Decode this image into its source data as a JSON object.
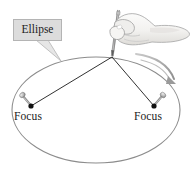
{
  "figure": {
    "width": 192,
    "height": 170,
    "background_color": "#ffffff"
  },
  "callout": {
    "label": "Ellipse",
    "box_fill": "#dcdcdc",
    "box_border": "#b4b4b4",
    "text_color": "#1c1c1c"
  },
  "labels": {
    "focus_left": "Focus",
    "focus_right": "Focus",
    "text_color": "#1a1a1a"
  },
  "ellipse": {
    "center_x": 96,
    "center_y": 110,
    "radius_x": 84,
    "radius_y": 53,
    "stroke_color": "#8c8c8c",
    "stroke_width": 1.1,
    "fill": "none"
  },
  "foci": [
    {
      "name": "focus-left",
      "x": 31,
      "y": 106,
      "dot_color": "#111111",
      "dot_radius": 2.6
    },
    {
      "name": "focus-right",
      "x": 154,
      "y": 106,
      "dot_color": "#111111",
      "dot_radius": 2.6
    }
  ],
  "pencil_point": {
    "x": 112,
    "y": 57
  },
  "string": {
    "stroke_color": "#1a1a1a",
    "stroke_width": 0.9,
    "segments": [
      {
        "name": "string-to-left-focus",
        "from_x": 112,
        "from_y": 57,
        "to_x": 31,
        "to_y": 106
      },
      {
        "name": "string-to-right-focus",
        "from_x": 112,
        "from_y": 57,
        "to_x": 154,
        "to_y": 106
      }
    ]
  },
  "pins": [
    {
      "name": "pin-left",
      "head_x": 23,
      "head_y": 96,
      "tip_x": 31,
      "tip_y": 105,
      "color": "#9a9a9a"
    },
    {
      "name": "pin-right",
      "head_x": 162,
      "head_y": 96,
      "tip_x": 155,
      "tip_y": 105,
      "color": "#9a9a9a"
    }
  ],
  "pencil": {
    "name": "pencil",
    "top_x": 118,
    "top_y": 10,
    "tip_x": 112,
    "tip_y": 57,
    "body_color": "#b8b8b8",
    "outline_color": "#6f6f6f"
  },
  "hand": {
    "name": "hand",
    "fill": "#f4f3f1",
    "outline_color": "#a9a9a9",
    "shade": "#e2e0dd"
  },
  "motion_arrow": {
    "name": "motion-arrow",
    "color": "#9f9f9f",
    "direction": "clockwise",
    "start_x": 139,
    "start_y": 57,
    "end_x": 175,
    "end_y": 82
  },
  "callout_tail": {
    "from_x": 40,
    "from_y": 41,
    "to_x": 60,
    "to_y": 60,
    "fill": "#e6e6e6",
    "stroke": "#b4b4b4"
  }
}
